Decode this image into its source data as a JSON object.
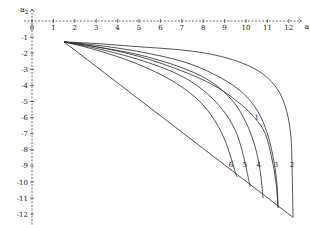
{
  "chart_data": {
    "type": "line",
    "title": "",
    "xlabel": "a1",
    "ylabel": "a2",
    "xlim": [
      0,
      12.5
    ],
    "ylim": [
      -12.5,
      0
    ],
    "x_ticks": [
      0,
      1,
      2,
      3,
      4,
      5,
      6,
      7,
      8,
      9,
      10,
      11,
      12
    ],
    "y_ticks": [
      -1,
      -2,
      -3,
      -4,
      -5,
      -6,
      -7,
      -8,
      -9,
      -10,
      -11,
      -12
    ],
    "x_tick_labels": [
      "0",
      "1",
      "2",
      "3",
      "4",
      "5",
      "6",
      "7",
      "8",
      "9",
      "10",
      "11",
      "12"
    ],
    "y_tick_labels": [
      "-1",
      "-2",
      "-3",
      "-4",
      "-5",
      "-6",
      "-7",
      "-8",
      "-9",
      "-10",
      "-11",
      "-12"
    ],
    "grid": false,
    "boundary": {
      "name": "boundary",
      "points": [
        [
          1.5,
          -1.3
        ],
        [
          12.2,
          -12.2
        ],
        [
          1.5,
          -1.3
        ]
      ]
    },
    "series": [
      {
        "name": "1",
        "label_at": [
          10.5,
          -6.0
        ],
        "points": [
          [
            1.5,
            -1.3
          ],
          [
            3,
            -1.6
          ],
          [
            5,
            -2.2
          ],
          [
            7,
            -3.1
          ],
          [
            8.5,
            -4.0
          ],
          [
            9.6,
            -5.0
          ],
          [
            10.4,
            -6.0
          ],
          [
            10.9,
            -7.0
          ],
          [
            11.2,
            -8.5
          ],
          [
            11.4,
            -10.0
          ],
          [
            11.5,
            -11.6
          ]
        ]
      },
      {
        "name": "2",
        "label_at": [
          12.15,
          -8.9
        ],
        "points": [
          [
            1.5,
            -1.3
          ],
          [
            3,
            -1.4
          ],
          [
            5,
            -1.6
          ],
          [
            7,
            -1.8
          ],
          [
            8.5,
            -2.1
          ],
          [
            9.8,
            -2.6
          ],
          [
            10.8,
            -3.3
          ],
          [
            11.5,
            -4.3
          ],
          [
            11.9,
            -5.6
          ],
          [
            12.1,
            -7.2
          ],
          [
            12.15,
            -9.0
          ],
          [
            12.2,
            -12.2
          ]
        ]
      },
      {
        "name": "3",
        "label_at": [
          11.4,
          -8.9
        ],
        "points": [
          [
            1.5,
            -1.3
          ],
          [
            3,
            -1.5
          ],
          [
            5,
            -1.9
          ],
          [
            7,
            -2.5
          ],
          [
            8.5,
            -3.3
          ],
          [
            9.7,
            -4.3
          ],
          [
            10.5,
            -5.5
          ],
          [
            11.0,
            -7.0
          ],
          [
            11.3,
            -8.7
          ],
          [
            11.45,
            -10.2
          ],
          [
            11.5,
            -11.6
          ]
        ]
      },
      {
        "name": "4",
        "label_at": [
          10.6,
          -8.9
        ],
        "points": [
          [
            1.5,
            -1.3
          ],
          [
            3,
            -1.6
          ],
          [
            5,
            -2.1
          ],
          [
            7,
            -2.9
          ],
          [
            8.4,
            -3.8
          ],
          [
            9.4,
            -5.0
          ],
          [
            10.0,
            -6.3
          ],
          [
            10.4,
            -7.7
          ],
          [
            10.65,
            -9.2
          ],
          [
            10.8,
            -11.0
          ]
        ]
      },
      {
        "name": "5",
        "label_at": [
          9.95,
          -8.9
        ],
        "points": [
          [
            1.5,
            -1.3
          ],
          [
            3,
            -1.7
          ],
          [
            5,
            -2.4
          ],
          [
            6.8,
            -3.3
          ],
          [
            8.0,
            -4.3
          ],
          [
            8.9,
            -5.5
          ],
          [
            9.5,
            -6.8
          ],
          [
            9.85,
            -8.2
          ],
          [
            10.05,
            -9.4
          ],
          [
            10.2,
            -10.3
          ]
        ]
      },
      {
        "name": "6",
        "label_at": [
          9.3,
          -8.9
        ],
        "points": [
          [
            1.5,
            -1.3
          ],
          [
            3,
            -1.8
          ],
          [
            4.8,
            -2.6
          ],
          [
            6.4,
            -3.6
          ],
          [
            7.6,
            -4.7
          ],
          [
            8.4,
            -5.9
          ],
          [
            8.95,
            -7.2
          ],
          [
            9.3,
            -8.5
          ],
          [
            9.5,
            -9.4
          ],
          [
            9.6,
            -9.7
          ]
        ]
      }
    ]
  }
}
